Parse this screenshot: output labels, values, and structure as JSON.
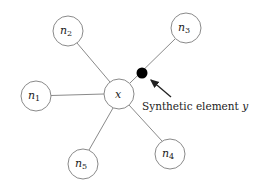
{
  "diagram": {
    "center": {
      "id": "x",
      "label": "x",
      "cx": 119,
      "cy": 94,
      "r": 15
    },
    "neighbors": [
      {
        "id": "n1",
        "base": "n",
        "sub": "1",
        "cx": 36,
        "cy": 96,
        "r": 15
      },
      {
        "id": "n2",
        "base": "n",
        "sub": "2",
        "cx": 68,
        "cy": 31,
        "r": 15
      },
      {
        "id": "n3",
        "base": "n",
        "sub": "3",
        "cx": 186,
        "cy": 28,
        "r": 15
      },
      {
        "id": "n4",
        "base": "n",
        "sub": "4",
        "cx": 170,
        "cy": 154,
        "r": 15
      },
      {
        "id": "n5",
        "base": "n",
        "sub": "5",
        "cx": 83,
        "cy": 164,
        "r": 15
      }
    ],
    "synthetic": {
      "cx": 142,
      "cy": 73,
      "r": 5,
      "color": "#000000"
    },
    "annotation": {
      "text": "Synthetic element ",
      "var": "y"
    },
    "colors": {
      "stroke": "#8a8a8a",
      "text": "#222222"
    }
  }
}
